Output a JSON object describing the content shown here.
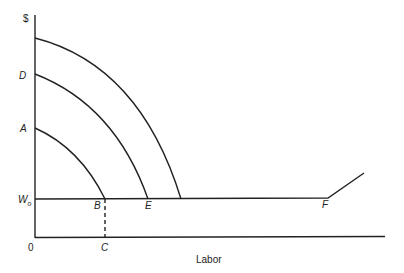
{
  "diagram": {
    "y_axis_label": "$",
    "x_axis_label": "Labor",
    "origin_label": "0",
    "points": {
      "A": "A",
      "B": "B",
      "C": "C",
      "D": "D",
      "E": "E",
      "F": "F"
    },
    "wage_label_main": "W",
    "wage_label_sub": "o",
    "line_color": "#222222"
  }
}
